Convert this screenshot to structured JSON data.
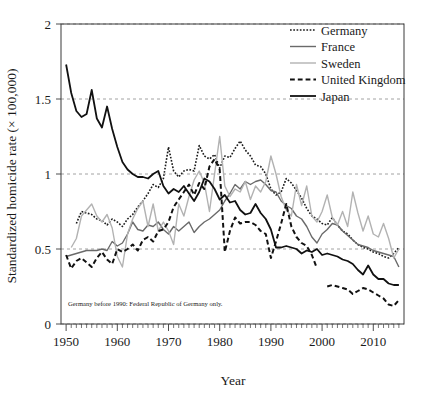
{
  "chart_data": {
    "type": "line",
    "title": "",
    "xlabel": "Year",
    "ylabel": "Standardized homicide rate (× 100,000)",
    "xlim": [
      1949,
      2016
    ],
    "ylim": [
      0,
      2
    ],
    "yticks": [
      0,
      0.5,
      1,
      1.5,
      2
    ],
    "ytick_labels": [
      "0",
      "0.5",
      "1",
      "1.5",
      "2"
    ],
    "xticks": [
      1950,
      1960,
      1970,
      1980,
      1990,
      2000,
      2010
    ],
    "xtick_labels": [
      "1950",
      "1960",
      "1970",
      "1980",
      "1990",
      "2000",
      "2010"
    ],
    "grid": true,
    "grid_axis": "y",
    "legend_position": "top-right",
    "annotation": "Germany before 1990: Federal Republic of Germany only.",
    "series": [
      {
        "name": "Germany",
        "style": "dotted",
        "color": "#1a1a1a",
        "width": 1.6,
        "x": [
          1952,
          1953,
          1954,
          1955,
          1956,
          1957,
          1958,
          1959,
          1960,
          1961,
          1962,
          1963,
          1964,
          1965,
          1966,
          1967,
          1968,
          1969,
          1970,
          1971,
          1972,
          1973,
          1974,
          1975,
          1976,
          1977,
          1978,
          1979,
          1980,
          1981,
          1982,
          1983,
          1984,
          1985,
          1986,
          1987,
          1988,
          1989,
          1990,
          1991,
          1992,
          1993,
          1994,
          1995,
          1996,
          1997,
          1998,
          1999,
          2000,
          2001,
          2002,
          2003,
          2004,
          2005,
          2006,
          2007,
          2008,
          2009,
          2010,
          2011,
          2012,
          2013,
          2014,
          2015
        ],
        "values": [
          0.67,
          0.75,
          0.74,
          0.73,
          0.7,
          0.69,
          0.66,
          0.7,
          0.68,
          0.65,
          0.7,
          0.73,
          0.78,
          0.82,
          0.87,
          0.93,
          0.91,
          0.97,
          1.18,
          1.02,
          0.98,
          1.02,
          1.03,
          1.02,
          1.19,
          1.12,
          1.1,
          1.13,
          1.04,
          1.12,
          1.11,
          1.17,
          1.22,
          1.16,
          1.12,
          1.06,
          1.05,
          1.0,
          0.9,
          0.86,
          0.88,
          0.97,
          0.94,
          0.89,
          0.84,
          0.77,
          0.72,
          0.7,
          0.67,
          0.66,
          0.71,
          0.66,
          0.62,
          0.6,
          0.56,
          0.53,
          0.51,
          0.5,
          0.48,
          0.47,
          0.45,
          0.44,
          0.47,
          0.51
        ]
      },
      {
        "name": "France",
        "style": "solid",
        "color": "#6a6a6a",
        "width": 1.4,
        "x": [
          1950,
          1951,
          1952,
          1953,
          1954,
          1955,
          1956,
          1957,
          1958,
          1959,
          1960,
          1961,
          1962,
          1963,
          1964,
          1965,
          1966,
          1967,
          1968,
          1969,
          1970,
          1971,
          1972,
          1973,
          1974,
          1975,
          1976,
          1977,
          1978,
          1979,
          1980,
          1981,
          1982,
          1983,
          1984,
          1985,
          1986,
          1987,
          1988,
          1989,
          1990,
          1991,
          1992,
          1993,
          1994,
          1995,
          1996,
          1997,
          1998,
          1999,
          2000,
          2001,
          2002,
          2003,
          2004,
          2005,
          2006,
          2007,
          2008,
          2009,
          2010,
          2011,
          2012,
          2013,
          2014,
          2015
        ],
        "values": [
          0.45,
          0.46,
          0.47,
          0.48,
          0.49,
          0.49,
          0.49,
          0.5,
          0.49,
          0.55,
          0.52,
          0.54,
          0.6,
          0.68,
          0.63,
          0.62,
          0.66,
          0.65,
          0.68,
          0.63,
          0.6,
          0.65,
          0.62,
          0.65,
          0.68,
          0.61,
          0.65,
          0.68,
          0.7,
          0.73,
          0.76,
          0.82,
          0.87,
          0.93,
          0.9,
          0.95,
          0.93,
          0.95,
          0.96,
          0.93,
          0.89,
          0.88,
          0.82,
          0.79,
          0.77,
          0.72,
          0.7,
          0.65,
          0.58,
          0.54,
          0.6,
          0.63,
          0.67,
          0.66,
          0.62,
          0.59,
          0.56,
          0.53,
          0.52,
          0.51,
          0.49,
          0.48,
          0.47,
          0.46,
          0.45,
          0.38
        ]
      },
      {
        "name": "Sweden",
        "style": "solid",
        "color": "#b2b2b2",
        "width": 1.4,
        "x": [
          1951,
          1952,
          1953,
          1954,
          1955,
          1956,
          1957,
          1958,
          1959,
          1960,
          1961,
          1962,
          1963,
          1964,
          1965,
          1966,
          1967,
          1968,
          1969,
          1970,
          1971,
          1972,
          1973,
          1974,
          1975,
          1976,
          1977,
          1978,
          1979,
          1980,
          1981,
          1982,
          1983,
          1984,
          1985,
          1986,
          1987,
          1988,
          1989,
          1990,
          1991,
          1992,
          1993,
          1994,
          1995,
          1996,
          1997,
          1998,
          1999,
          2000,
          2001,
          2002,
          2003,
          2004,
          2005,
          2006,
          2007,
          2008,
          2009,
          2010,
          2011,
          2012,
          2013,
          2014,
          2015
        ],
        "values": [
          0.51,
          0.57,
          0.72,
          0.76,
          0.8,
          0.72,
          0.68,
          0.73,
          0.64,
          0.45,
          0.38,
          0.6,
          0.7,
          0.77,
          0.82,
          0.65,
          0.8,
          0.62,
          0.68,
          0.62,
          0.53,
          0.8,
          0.72,
          0.85,
          0.96,
          1.02,
          0.94,
          0.75,
          1.0,
          1.25,
          0.92,
          0.85,
          0.9,
          0.88,
          0.95,
          0.83,
          0.92,
          0.88,
          0.95,
          1.12,
          1.0,
          0.85,
          0.76,
          0.72,
          0.93,
          0.79,
          0.92,
          0.72,
          0.68,
          0.75,
          0.86,
          0.71,
          0.66,
          0.75,
          0.65,
          0.88,
          0.74,
          0.62,
          0.72,
          0.6,
          0.58,
          0.67,
          0.57,
          0.44,
          0.5
        ]
      },
      {
        "name": "United Kingdom",
        "style": "dashed",
        "color": "#111111",
        "width": 2.0,
        "x": [
          1950,
          1951,
          1952,
          1953,
          1954,
          1955,
          1956,
          1957,
          1958,
          1959,
          1960,
          1961,
          1962,
          1963,
          1964,
          1965,
          1966,
          1967,
          1968,
          1969,
          1970,
          1971,
          1972,
          1973,
          1974,
          1975,
          1976,
          1977,
          1978,
          1979,
          1980,
          1981,
          1982,
          1983,
          1984,
          1985,
          1986,
          1987,
          1988,
          1989,
          1990,
          1991,
          1992,
          1993,
          1994,
          1995,
          1996,
          1997,
          1998,
          1999,
          2001,
          2002,
          2003,
          2004,
          2005,
          2006,
          2007,
          2008,
          2009,
          2010,
          2011,
          2012,
          2013,
          2014,
          2015
        ],
        "values": [
          0.46,
          0.37,
          0.42,
          0.44,
          0.41,
          0.38,
          0.44,
          0.48,
          0.43,
          0.4,
          0.5,
          0.48,
          0.5,
          0.53,
          0.49,
          0.56,
          0.58,
          0.55,
          0.62,
          0.63,
          0.68,
          0.78,
          0.83,
          0.88,
          0.93,
          0.86,
          0.94,
          0.9,
          1.05,
          1.1,
          1.03,
          0.48,
          0.62,
          0.71,
          0.67,
          0.68,
          0.68,
          0.66,
          0.62,
          0.6,
          0.44,
          0.55,
          0.67,
          0.8,
          0.65,
          0.58,
          0.54,
          0.52,
          0.46,
          0.37,
          0.25,
          0.26,
          0.25,
          0.24,
          0.23,
          0.2,
          0.22,
          0.24,
          0.23,
          0.21,
          0.19,
          0.17,
          0.13,
          0.12,
          0.16
        ]
      },
      {
        "name": "Japan",
        "style": "solid",
        "color": "#111111",
        "width": 1.8,
        "x": [
          1950,
          1951,
          1952,
          1953,
          1954,
          1955,
          1956,
          1957,
          1958,
          1959,
          1960,
          1961,
          1962,
          1963,
          1964,
          1965,
          1966,
          1967,
          1968,
          1969,
          1970,
          1971,
          1972,
          1973,
          1974,
          1975,
          1976,
          1977,
          1978,
          1979,
          1980,
          1981,
          1982,
          1983,
          1984,
          1985,
          1986,
          1987,
          1988,
          1989,
          1990,
          1991,
          1992,
          1993,
          1994,
          1995,
          1996,
          1997,
          1998,
          1999,
          2000,
          2001,
          2002,
          2003,
          2004,
          2005,
          2006,
          2007,
          2008,
          2009,
          2010,
          2011,
          2012,
          2013,
          2014,
          2015
        ],
        "values": [
          1.73,
          1.54,
          1.42,
          1.38,
          1.4,
          1.56,
          1.37,
          1.31,
          1.45,
          1.3,
          1.18,
          1.08,
          1.03,
          1.0,
          0.98,
          0.98,
          0.97,
          1.0,
          1.02,
          0.92,
          0.87,
          0.9,
          0.88,
          0.92,
          0.87,
          0.82,
          0.88,
          0.97,
          0.95,
          0.9,
          0.83,
          0.86,
          0.81,
          0.82,
          0.76,
          0.73,
          0.74,
          0.8,
          0.74,
          0.7,
          0.63,
          0.51,
          0.51,
          0.52,
          0.51,
          0.5,
          0.47,
          0.49,
          0.48,
          0.5,
          0.46,
          0.47,
          0.46,
          0.45,
          0.43,
          0.42,
          0.4,
          0.36,
          0.33,
          0.39,
          0.33,
          0.3,
          0.3,
          0.27,
          0.26,
          0.26
        ]
      }
    ]
  },
  "legend": {
    "items": [
      {
        "label": "Germany"
      },
      {
        "label": "France"
      },
      {
        "label": "Sweden"
      },
      {
        "label": "United Kingdom"
      },
      {
        "label": "Japan"
      }
    ]
  }
}
